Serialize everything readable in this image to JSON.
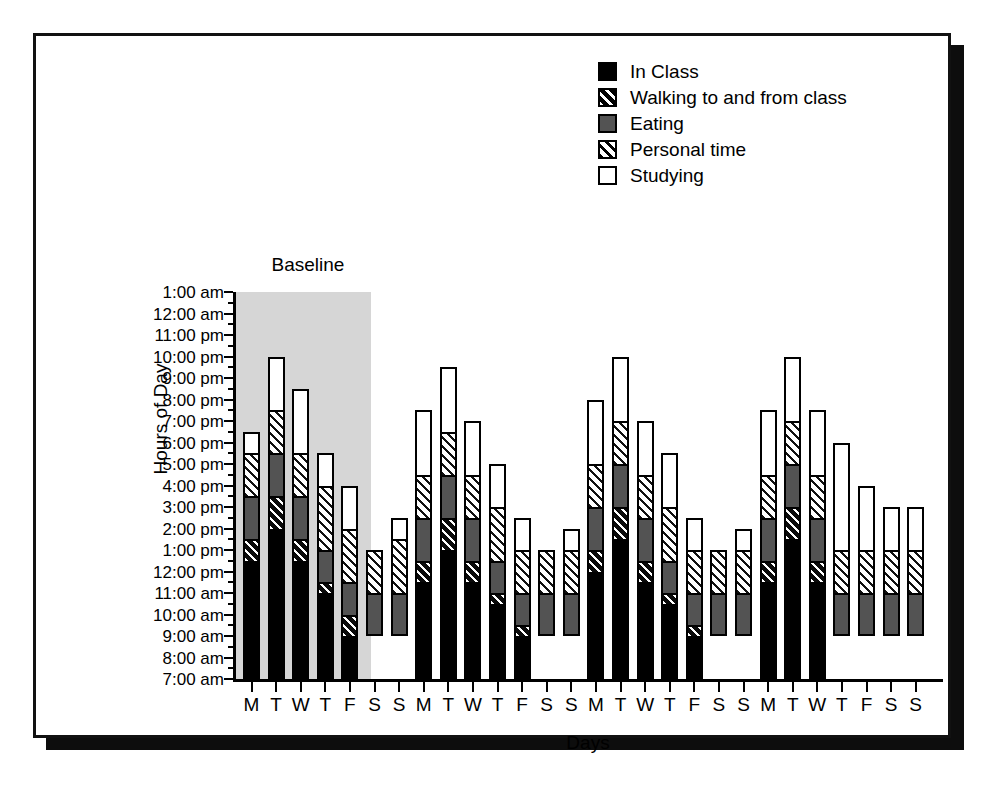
{
  "figure": {
    "y_axis_title": "Hours of Day",
    "x_axis_title": "Days",
    "annotation": "Baseline"
  },
  "legend": {
    "items": [
      {
        "label": "In Class",
        "swatch": "solid-black",
        "color": "#000000"
      },
      {
        "label": "Walking to and from class",
        "swatch": "black-with-white-diagonal-hatch",
        "color": "#000000"
      },
      {
        "label": "Eating",
        "swatch": "solid-dark-gray",
        "color": "#535353"
      },
      {
        "label": "Personal time",
        "swatch": "white-with-black-diagonal-hatch",
        "color": "#ffffff"
      },
      {
        "label": "Studying",
        "swatch": "solid-white",
        "color": "#ffffff"
      }
    ]
  },
  "y_ticks": [
    "1:00 am",
    "12:00 am",
    "11:00 pm",
    "10:00 pm",
    "9:00 pm",
    "8:00 pm",
    "7:00 pm",
    "6:00 pm",
    "5:00 pm",
    "4:00 pm",
    "3:00 pm",
    "2:00 pm",
    "1:00 pm",
    "12:00 pm",
    "11:00 am",
    "10:00 am",
    "9:00 am",
    "8:00 am",
    "7:00 am"
  ],
  "chart_data": {
    "type": "bar",
    "subtype": "stacked-bar",
    "title": "",
    "xlabel": "Days",
    "ylabel": "Hours of Day",
    "ylim": [
      7,
      25
    ],
    "ytick_values": [
      25,
      24,
      23,
      22,
      21,
      20,
      19,
      18,
      17,
      16,
      15,
      14,
      13,
      12,
      11,
      10,
      9,
      8,
      7
    ],
    "ytick_labels": [
      "1:00 am",
      "12:00 am",
      "11:00 pm",
      "10:00 pm",
      "9:00 pm",
      "8:00 pm",
      "7:00 pm",
      "6:00 pm",
      "5:00 pm",
      "4:00 pm",
      "3:00 pm",
      "2:00 pm",
      "1:00 pm",
      "12:00 pm",
      "11:00 am",
      "10:00 am",
      "9:00 am",
      "8:00 am",
      "7:00 am"
    ],
    "grid": false,
    "legend_position": "top-right",
    "annotations": [
      {
        "text": "Baseline",
        "covers_categories": [
          "M",
          "T",
          "W",
          "T",
          "F"
        ],
        "shaded": true,
        "shade_color": "#d6d6d6"
      }
    ],
    "categories": [
      "M",
      "T",
      "W",
      "T",
      "F",
      "S",
      "S",
      "M",
      "T",
      "W",
      "T",
      "F",
      "S",
      "S",
      "M",
      "T",
      "W",
      "T",
      "F",
      "S",
      "S",
      "M",
      "T",
      "W",
      "T",
      "F",
      "S",
      "S"
    ],
    "series": [
      {
        "name": "In Class",
        "values": [
          5.5,
          7.0,
          5.5,
          4.0,
          2.0,
          0,
          0,
          4.5,
          6.0,
          4.5,
          3.5,
          2.0,
          0,
          0,
          5.0,
          6.5,
          4.5,
          3.5,
          2.0,
          0,
          0,
          4.5,
          6.5,
          4.5,
          0,
          0,
          0,
          0
        ]
      },
      {
        "name": "Walking to and from class",
        "values": [
          1.0,
          1.5,
          1.0,
          0.5,
          1.0,
          0,
          0,
          1.0,
          1.5,
          1.0,
          0.5,
          0.5,
          0,
          0,
          1.0,
          1.5,
          1.0,
          0.5,
          0.5,
          0,
          0,
          1.0,
          1.5,
          1.0,
          0,
          0,
          0,
          0
        ]
      },
      {
        "name": "Eating",
        "values": [
          2.0,
          2.0,
          2.0,
          1.5,
          1.5,
          2.0,
          2.0,
          2.0,
          2.0,
          2.0,
          1.5,
          1.5,
          2.0,
          2.0,
          2.0,
          2.0,
          2.0,
          1.5,
          1.5,
          2.0,
          2.0,
          2.0,
          2.0,
          2.0,
          2.0,
          2.0,
          2.0,
          2.0
        ],
        "comment": ""
      },
      {
        "name": "Personal time",
        "values": [
          2.0,
          2.0,
          2.0,
          3.0,
          2.5,
          2.0,
          2.5,
          2.0,
          2.0,
          2.0,
          2.5,
          2.0,
          2.0,
          2.0,
          2.0,
          2.0,
          2.0,
          2.5,
          2.0,
          2.0,
          2.0,
          2.0,
          2.0,
          2.0,
          2.0,
          2.0,
          2.0,
          2.0
        ]
      },
      {
        "name": "Studying",
        "values": [
          1.0,
          2.5,
          3.0,
          1.5,
          2.0,
          0,
          1.0,
          3.0,
          3.0,
          2.5,
          2.0,
          1.5,
          0,
          1.0,
          3.0,
          3.0,
          2.5,
          2.5,
          1.5,
          0,
          1.0,
          3.0,
          3.0,
          3.0,
          5.0,
          3.0,
          2.0,
          2.0
        ]
      }
    ],
    "bar_totals_end_time": [
      "6:30 pm",
      "9:30 pm",
      "8:30 pm",
      "6:00 pm",
      "4:00 pm",
      "11:00 am",
      "1:00 pm",
      "7:30 pm",
      "10:30 pm",
      "7:30 pm",
      "6:30 pm",
      "4:00 pm",
      "11:00 am",
      "12:00 pm",
      "8:30 pm",
      "12:00 am",
      "7:30 pm",
      "7:00 pm",
      "4:00 pm",
      "11:00 am",
      "1:00 pm",
      "9:30 pm",
      "11:30 pm",
      "10:30 pm",
      "4:00 pm",
      "2:00 pm",
      "1:00 pm",
      "1:00 pm"
    ],
    "bar_start_time": [
      "7:00 am",
      "7:00 am",
      "7:00 am",
      "7:00 am",
      "7:00 am",
      "9:00 am",
      "9:00 am",
      "7:00 am",
      "7:00 am",
      "7:00 am",
      "7:00 am",
      "7:00 am",
      "9:00 am",
      "9:00 am",
      "7:00 am",
      "7:00 am",
      "7:00 am",
      "7:00 am",
      "7:00 am",
      "9:00 am",
      "9:00 am",
      "7:00 am",
      "7:00 am",
      "7:00 am",
      "9:00 am",
      "9:00 am",
      "9:00 am",
      "9:00 am"
    ]
  }
}
